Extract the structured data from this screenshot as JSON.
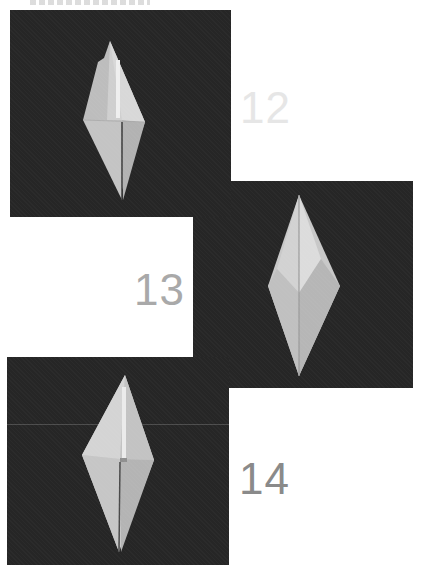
{
  "document": {
    "type": "origami folding instructions",
    "header_text_visible": false
  },
  "steps": [
    {
      "number": "12",
      "label_color": "#e6e6e6",
      "image_alt": "Origami crane base, step 12"
    },
    {
      "number": "13",
      "label_color": "#a9a9a9",
      "image_alt": "Origami crane base, step 13"
    },
    {
      "number": "14",
      "label_color": "#8a8a8a",
      "image_alt": "Origami crane base, step 14"
    }
  ],
  "colors": {
    "photo_background": "#262626",
    "paper_light": "#d9d9d9",
    "paper_mid": "#bcbcbc",
    "paper_shadow": "#a4a4a4"
  }
}
